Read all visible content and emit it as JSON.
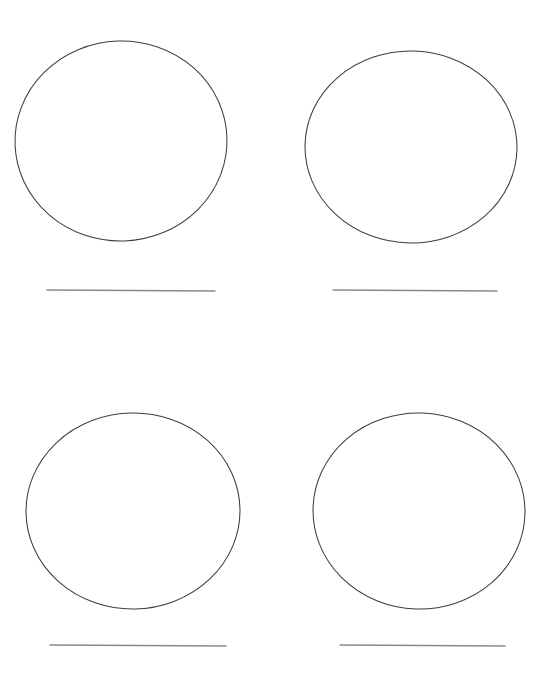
{
  "page": {
    "title": "Blank Circles Worksheet",
    "width": 555,
    "height": 680,
    "background_color": "#ffffff",
    "ink_color": "#3a3a3a",
    "rule_line_color": "#808080"
  },
  "layout": {
    "type": "grid",
    "rows": 2,
    "columns": 2
  },
  "items": [
    {
      "id": "circle-1",
      "name": "circle-top-left",
      "shape": "circle",
      "label": "",
      "outline_color": "#3d3d3d",
      "fill_color": "none",
      "stroke_width": 1,
      "center_x": 121,
      "center_y": 141,
      "radius_x": 106,
      "radius_y": 100,
      "rotation": -2,
      "answer_line": {
        "name": "answer-line-1",
        "x1": 47,
        "y1": 290,
        "x2": 215,
        "y2": 291,
        "color": "#8a8a8a",
        "value": "",
        "placeholder": ""
      }
    },
    {
      "id": "circle-2",
      "name": "circle-top-right",
      "shape": "circle",
      "label": "",
      "outline_color": "#3d3d3d",
      "fill_color": "none",
      "stroke_width": 1,
      "center_x": 411,
      "center_y": 147,
      "radius_x": 106,
      "radius_y": 96,
      "rotation": 1,
      "answer_line": {
        "name": "answer-line-2",
        "x1": 333,
        "y1": 290,
        "x2": 497,
        "y2": 291,
        "color": "#8a8a8a",
        "value": "",
        "placeholder": ""
      }
    },
    {
      "id": "circle-3",
      "name": "circle-bottom-left",
      "shape": "circle",
      "label": "",
      "outline_color": "#3d3d3d",
      "fill_color": "none",
      "stroke_width": 1,
      "center_x": 133,
      "center_y": 511,
      "radius_x": 107,
      "radius_y": 98,
      "rotation": -1,
      "answer_line": {
        "name": "answer-line-3",
        "x1": 50,
        "y1": 645,
        "x2": 226,
        "y2": 646,
        "color": "#8a8a8a",
        "value": "",
        "placeholder": ""
      }
    },
    {
      "id": "circle-4",
      "name": "circle-bottom-right",
      "shape": "circle",
      "label": "",
      "outline_color": "#3d3d3d",
      "fill_color": "none",
      "stroke_width": 1,
      "center_x": 419,
      "center_y": 511,
      "radius_x": 106,
      "radius_y": 98,
      "rotation": 2,
      "answer_line": {
        "name": "answer-line-4",
        "x1": 340,
        "y1": 645,
        "x2": 505,
        "y2": 646,
        "color": "#8a8a8a",
        "value": "",
        "placeholder": ""
      }
    }
  ]
}
